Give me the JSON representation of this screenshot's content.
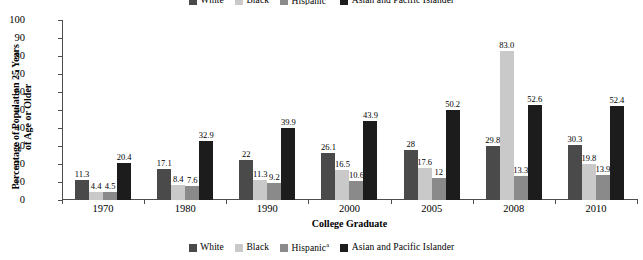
{
  "chart_data": {
    "type": "bar",
    "title": "",
    "subtitle": "",
    "xlabel": "College Graduate",
    "ylabel": "Percentage of Population 25 Years\nof Age or Older",
    "ylabel_line1": "Percentage of Population 25 Years",
    "ylabel_line2": "of Age or Older",
    "categories": [
      "1970",
      "1980",
      "1990",
      "2000",
      "2005",
      "2008",
      "2010"
    ],
    "ylim": [
      0,
      100
    ],
    "yticks": [
      0,
      10,
      20,
      30,
      40,
      50,
      60,
      70,
      80,
      90,
      100
    ],
    "ytick_labels": [
      "0",
      "10",
      "20",
      "30",
      "40",
      "50",
      "60",
      "70",
      "80",
      "90",
      "100"
    ],
    "grid": false,
    "legend_position": "bottom",
    "series": [
      {
        "name": "White",
        "color": "#4a4a4a",
        "values": [
          11.3,
          17.1,
          22,
          26.1,
          28,
          29.8,
          30.3
        ],
        "labels": [
          "11.3",
          "17.1",
          "22",
          "26.1",
          "28",
          "29.8",
          "30.3"
        ]
      },
      {
        "name": "Black",
        "color": "#c9c9c9",
        "values": [
          4.4,
          8.4,
          11.3,
          16.5,
          17.6,
          83.0,
          19.8
        ],
        "labels": [
          "4.4",
          "8.4",
          "11.3",
          "16.5",
          "17.6",
          "83.0",
          "19.8"
        ]
      },
      {
        "name": "Hispanic",
        "name_superscript": "a",
        "color": "#8a8a8a",
        "values": [
          4.5,
          7.6,
          9.2,
          10.6,
          12,
          13.3,
          13.9
        ],
        "labels": [
          "4.5",
          "7.6",
          "9.2",
          "10.6",
          "12",
          "13.3",
          "13.9"
        ]
      },
      {
        "name": "Asian and Pacific Islander",
        "color": "#1c1c1c",
        "values": [
          20.4,
          32.9,
          39.9,
          43.9,
          50.2,
          52.6,
          52.4
        ],
        "labels": [
          "20.4",
          "32.9",
          "39.9",
          "43.9",
          "50.2",
          "52.6",
          "52.4"
        ]
      }
    ]
  },
  "legend": {
    "items": [
      {
        "label": "White",
        "sup": "",
        "color": "#4a4a4a"
      },
      {
        "label": "Black",
        "sup": "",
        "color": "#c9c9c9"
      },
      {
        "label": "Hispanic",
        "sup": "a",
        "color": "#8a8a8a"
      },
      {
        "label": "Asian and Pacific Islander",
        "sup": "",
        "color": "#1c1c1c"
      }
    ]
  }
}
